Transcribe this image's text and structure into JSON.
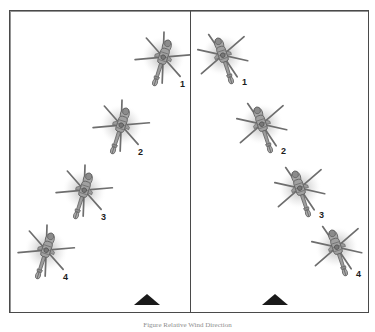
{
  "figure": {
    "caption": "Figure  Relative Wind Direction",
    "frame": {
      "border_color": "#4a4a4a"
    },
    "rotor_color": "#6e6e6e",
    "body_color": "#9a9a9a",
    "wash_color": "#c9c9c9",
    "marker_color": "#1a1a1a"
  },
  "panels": [
    {
      "name": "left-panel",
      "marker": {
        "label": "ground-marker",
        "x": 124,
        "y": 283
      },
      "helicopters": [
        {
          "id": "1",
          "x": 152,
          "y": 50,
          "label_x": 170,
          "label_y": 69,
          "rotation": 18
        },
        {
          "id": "2",
          "x": 110,
          "y": 118,
          "label_x": 128,
          "label_y": 137,
          "rotation": 18
        },
        {
          "id": "3",
          "x": 73,
          "y": 183,
          "label_x": 91,
          "label_y": 202,
          "rotation": 18
        },
        {
          "id": "4",
          "x": 35,
          "y": 243,
          "label_x": 53,
          "label_y": 262,
          "rotation": 18
        }
      ]
    },
    {
      "name": "right-panel",
      "marker": {
        "label": "ground-marker",
        "x": 72,
        "y": 283
      },
      "helicopters": [
        {
          "id": "1",
          "x": 34,
          "y": 48,
          "label_x": 52,
          "label_y": 67,
          "rotation": -18
        },
        {
          "id": "2",
          "x": 73,
          "y": 117,
          "label_x": 91,
          "label_y": 136,
          "rotation": -18
        },
        {
          "id": "3",
          "x": 111,
          "y": 181,
          "label_x": 129,
          "label_y": 200,
          "rotation": -18
        },
        {
          "id": "4",
          "x": 148,
          "y": 240,
          "label_x": 166,
          "label_y": 259,
          "rotation": -18
        }
      ]
    }
  ]
}
